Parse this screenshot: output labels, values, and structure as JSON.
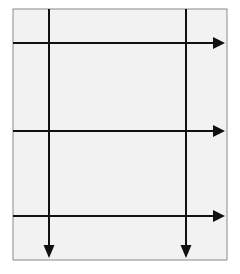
{
  "diagram": {
    "type": "grid-arrow-diagram",
    "colors": {
      "background": "#ffffff",
      "panel_fill": "#f2f2f2",
      "panel_border": "#8a8a8a",
      "line": "#111111"
    },
    "panel": {
      "x": 13,
      "y": 9,
      "width": 214,
      "height": 251
    },
    "vertical_arrows": [
      {
        "x": 49,
        "y1": 9,
        "y2": 258,
        "direction": "down"
      },
      {
        "x": 186,
        "y1": 9,
        "y2": 258,
        "direction": "down"
      }
    ],
    "horizontal_arrows": [
      {
        "y": 43,
        "x1": 13,
        "x2": 225,
        "direction": "right"
      },
      {
        "y": 131,
        "x1": 13,
        "x2": 225,
        "direction": "right"
      },
      {
        "y": 216,
        "x1": 13,
        "x2": 225,
        "direction": "right"
      }
    ]
  }
}
